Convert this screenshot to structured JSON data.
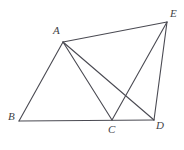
{
  "figure": {
    "kind": "plane-geometry-diagram",
    "background_color": "#ffffff",
    "stroke_color": "#4a4a52",
    "label_color": "#3f3f46",
    "stroke_width": 1.1,
    "canvas": {
      "width": 184,
      "height": 150
    },
    "vertices": [
      {
        "id": "A",
        "label": "A",
        "x": 63,
        "y": 42,
        "label_x": 53,
        "label_y": 25
      },
      {
        "id": "B",
        "label": "B",
        "x": 19,
        "y": 121,
        "label_x": 8,
        "label_y": 111
      },
      {
        "id": "C",
        "label": "C",
        "x": 112,
        "y": 120,
        "label_x": 108,
        "label_y": 124
      },
      {
        "id": "D",
        "label": "D",
        "x": 154,
        "y": 120,
        "label_x": 156,
        "label_y": 120
      },
      {
        "id": "E",
        "label": "E",
        "x": 167,
        "y": 22,
        "label_x": 170,
        "label_y": 8
      }
    ],
    "segments": [
      {
        "name": "segment-A-B",
        "from": "A",
        "to": "B"
      },
      {
        "name": "segment-A-C",
        "from": "A",
        "to": "C"
      },
      {
        "name": "segment-A-D",
        "from": "A",
        "to": "D"
      },
      {
        "name": "segment-A-E",
        "from": "A",
        "to": "E"
      },
      {
        "name": "segment-B-D",
        "from": "B",
        "to": "D"
      },
      {
        "name": "segment-C-E",
        "from": "C",
        "to": "E"
      },
      {
        "name": "segment-D-E",
        "from": "D",
        "to": "E"
      }
    ],
    "intersections": [
      {
        "name": "crossing-AD-CE",
        "x": 128,
        "y": 95
      }
    ]
  }
}
